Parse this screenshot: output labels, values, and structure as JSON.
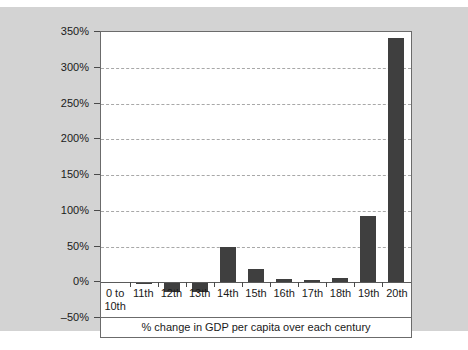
{
  "chart_data": {
    "type": "bar",
    "title": "",
    "xlabel": "% change in GDP per capita over each century",
    "ylabel": "",
    "ylim": [
      -50,
      350
    ],
    "ytick_step": 50,
    "grid": true,
    "legend": "none",
    "bar_color": "#3f3f3f",
    "plot_background": "#ffffff",
    "panel_background": "#d3d3d3",
    "categories": [
      "0 to 10th",
      "11th",
      "12th",
      "13th",
      "14th",
      "15th",
      "16th",
      "17th",
      "18th",
      "19th",
      "20th"
    ],
    "category_lines": [
      [
        "0 to",
        "10th"
      ],
      [
        "11th",
        ""
      ],
      [
        "12th",
        ""
      ],
      [
        "13th",
        ""
      ],
      [
        "14th",
        ""
      ],
      [
        "15th",
        ""
      ],
      [
        "16th",
        ""
      ],
      [
        "17th",
        ""
      ],
      [
        "18th",
        ""
      ],
      [
        "19th",
        ""
      ],
      [
        "20th",
        ""
      ]
    ],
    "values": [
      0,
      -2,
      -13,
      -13,
      49,
      19,
      4,
      3,
      6,
      92,
      342
    ],
    "ytick_labels": [
      "350%",
      "300%",
      "250%",
      "200%",
      "150%",
      "100%",
      "50%",
      "0%",
      "‒50%"
    ],
    "ytick_values": [
      350,
      300,
      250,
      200,
      150,
      100,
      50,
      0,
      -50
    ]
  }
}
